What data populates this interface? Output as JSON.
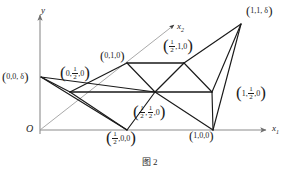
{
  "figure": {
    "caption": "图 2",
    "axes": {
      "y_label": "y",
      "x1_label": "x",
      "x1_sub": "1",
      "x2_label": "x",
      "x2_sub": "2",
      "origin_label": "O"
    },
    "colors": {
      "stroke_dark": "#1a1a1a",
      "stroke_axis": "#8a8a8a",
      "stroke_faint": "#9a9a9a",
      "background": "#ffffff",
      "text": "#1c1c1c"
    },
    "vertices": [
      {
        "id": "origin",
        "label_plain": "O",
        "x": 40,
        "y": 130,
        "label_x": 26,
        "label_y": 126,
        "labeled": true,
        "style": "axis-origin"
      },
      {
        "id": "v_0_0_d",
        "label_plain": "(0,0, δ)",
        "x": 41,
        "y": 77,
        "label_x": 2,
        "label_y": 73,
        "labeled": true,
        "style": "plain"
      },
      {
        "id": "v_0_half_0",
        "label_plain": "(0,1/2,0)",
        "x": 70,
        "y": 92,
        "label_x": 61,
        "label_y": 68,
        "labeled": true,
        "style": "frac-mid"
      },
      {
        "id": "v_0_1_0",
        "label_plain": "(0,1,0)",
        "x": 127,
        "y": 63,
        "label_x": 101,
        "label_y": 52,
        "labeled": true,
        "style": "plain"
      },
      {
        "id": "v_half_0_0",
        "label_plain": "(1/2,0,0)",
        "x": 127,
        "y": 130,
        "label_x": 108,
        "label_y": 132,
        "labeled": true,
        "style": "frac-first"
      },
      {
        "id": "v_half_half_0",
        "label_plain": "(1/2,1/2,0)",
        "x": 155,
        "y": 92,
        "label_x": 135,
        "label_y": 108,
        "labeled": true,
        "style": "frac-both"
      },
      {
        "id": "v_half_1_0",
        "label_plain": "(1/2,1,0)",
        "x": 184,
        "y": 63,
        "label_x": 165,
        "label_y": 41,
        "labeled": true,
        "style": "frac-first"
      },
      {
        "id": "v_1_0_0",
        "label_plain": "(1,0,0)",
        "x": 213,
        "y": 130,
        "label_x": 190,
        "label_y": 132,
        "labeled": true,
        "style": "plain"
      },
      {
        "id": "v_1_half_0",
        "label_plain": "(1,1/2,0)",
        "x": 212,
        "y": 92,
        "label_x": 238,
        "label_y": 86,
        "labeled": true,
        "style": "frac-second"
      },
      {
        "id": "v_1_1_d",
        "label_plain": "(1,1, δ)",
        "x": 241,
        "y": 24,
        "label_x": 246,
        "label_y": 8,
        "labeled": true,
        "style": "plain"
      }
    ],
    "labels": {
      "v_0_0_d": {
        "open": "(",
        "parts": [
          "0,0, δ"
        ],
        "close": ")"
      },
      "v_0_half_0": {
        "open": "(",
        "pre": "0,",
        "frac": [
          "1",
          "2"
        ],
        "post": ",0",
        "close": ")"
      },
      "v_0_1_0": {
        "open": "(",
        "parts": [
          "0,1,0"
        ],
        "close": ")"
      },
      "v_half_0_0": {
        "open": "(",
        "frac": [
          "1",
          "2"
        ],
        "post": ",0,0",
        "close": ")"
      },
      "v_half_half_0": {
        "open": "(",
        "frac1": [
          "1",
          "2"
        ],
        "mid": ",",
        "frac2": [
          "1",
          "2"
        ],
        "post": ",0",
        "close": ")"
      },
      "v_half_1_0": {
        "open": "(",
        "frac": [
          "1",
          "2"
        ],
        "post": ",1,0",
        "close": ")"
      },
      "v_1_0_0": {
        "open": "(",
        "parts": [
          "1,0,0"
        ],
        "close": ")"
      },
      "v_1_half_0": {
        "open": "(",
        "pre": "1,",
        "frac": [
          "1",
          "2"
        ],
        "post": ",0",
        "close": ")"
      },
      "v_1_1_d": {
        "open": "(",
        "parts": [
          "1,1, δ"
        ],
        "close": ")"
      }
    },
    "edges": [
      {
        "from": "v_0_0_d",
        "to": "v_0_half_0",
        "weight": "heavy"
      },
      {
        "from": "v_0_0_d",
        "to": "v_half_half_0",
        "weight": "heavy"
      },
      {
        "from": "v_0_0_d",
        "to": "v_half_0_0",
        "weight": "heavy"
      },
      {
        "from": "v_0_half_0",
        "to": "v_0_1_0",
        "weight": "heavy"
      },
      {
        "from": "v_0_half_0",
        "to": "v_half_0_0",
        "weight": "heavy"
      },
      {
        "from": "v_0_half_0",
        "to": "v_1_half_0",
        "weight": "heavy"
      },
      {
        "from": "v_0_1_0",
        "to": "v_half_1_0",
        "weight": "heavy"
      },
      {
        "from": "v_0_1_0",
        "to": "v_half_half_0",
        "weight": "heavy"
      },
      {
        "from": "v_half_0_0",
        "to": "v_half_half_0",
        "weight": "heavy"
      },
      {
        "from": "v_half_0_0",
        "to": "v_1_0_0",
        "weight": "axis-seg"
      },
      {
        "from": "v_half_half_0",
        "to": "v_half_1_0",
        "weight": "heavy"
      },
      {
        "from": "v_half_half_0",
        "to": "v_1_0_0",
        "weight": "heavy"
      },
      {
        "from": "v_half_1_0",
        "to": "v_1_half_0",
        "weight": "heavy"
      },
      {
        "from": "v_half_1_0",
        "to": "v_1_1_d",
        "weight": "heavy"
      },
      {
        "from": "v_1_0_0",
        "to": "v_1_half_0",
        "weight": "heavy"
      },
      {
        "from": "v_1_0_0",
        "to": "v_1_1_d",
        "weight": "heavy"
      },
      {
        "from": "v_1_half_0",
        "to": "v_1_1_d",
        "weight": "heavy"
      }
    ],
    "axis_lines": {
      "y_axis": {
        "x1": 40,
        "y1": 134,
        "x2": 40,
        "y2": 14
      },
      "x1_axis": {
        "x1": 40,
        "y1": 130,
        "x2": 268,
        "y2": 130
      },
      "x2_axis": {
        "x1": 40,
        "y1": 130,
        "x2": 175,
        "y2": 24
      }
    }
  }
}
